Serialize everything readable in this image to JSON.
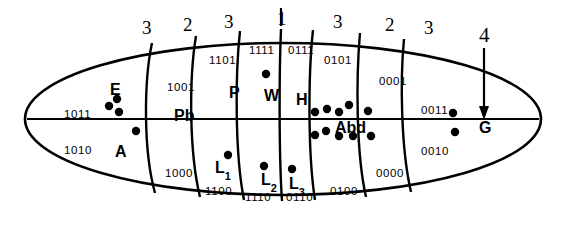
{
  "figure": {
    "type": "fate-map-diagram",
    "outline_shape": "ellipse",
    "midline": "horizontal"
  },
  "top_numbers": [
    {
      "id": "t1",
      "label": "3",
      "x": 142,
      "y": 18
    },
    {
      "id": "t2",
      "label": "2",
      "x": 183,
      "y": 15
    },
    {
      "id": "t3",
      "label": "3",
      "x": 224,
      "y": 12
    },
    {
      "id": "t4",
      "label": "1",
      "x": 277,
      "y": 9
    },
    {
      "id": "t5",
      "label": "3",
      "x": 333,
      "y": 12
    },
    {
      "id": "t6",
      "label": "2",
      "x": 385,
      "y": 15
    },
    {
      "id": "t7",
      "label": "3",
      "x": 424,
      "y": 18
    }
  ],
  "right_number": {
    "label": "4",
    "x": 479,
    "y": 25
  },
  "segments": [
    {
      "key": "E",
      "name": "E",
      "name_x": 110,
      "name_y": 82,
      "code_top": "1011",
      "code_top_x": 64,
      "code_top_y": 109,
      "code_bot": "1010",
      "code_bot_x": 64,
      "code_bot_y": 145
    },
    {
      "key": "A",
      "name": "A",
      "name_x": 115,
      "name_y": 144,
      "code_top": "",
      "code_top_x": 0,
      "code_top_y": 0,
      "code_bot": "",
      "code_bot_x": 0,
      "code_bot_y": 0
    },
    {
      "key": "Pb",
      "name": "Pb",
      "name_x": 174,
      "name_y": 108,
      "code_top": "1001",
      "code_top_x": 167,
      "code_top_y": 82,
      "code_bot": "1000",
      "code_bot_x": 165,
      "code_bot_y": 168
    },
    {
      "key": "P",
      "name": "P",
      "name_x": 229,
      "name_y": 85,
      "code_top": "1101",
      "code_top_x": 209,
      "code_top_y": 55,
      "code_bot": "1100",
      "code_bot_x": 205,
      "code_bot_y": 186
    },
    {
      "key": "W",
      "name": "W",
      "name_x": 264,
      "name_y": 88,
      "code_top": "1111",
      "code_top_x": 249,
      "code_top_y": 45,
      "code_bot": "1110",
      "code_bot_x": 245,
      "code_bot_y": 192
    },
    {
      "key": "H",
      "name": "H",
      "name_x": 296,
      "name_y": 92,
      "code_top": "0111",
      "code_top_x": 288,
      "code_top_y": 45,
      "code_bot": "0110",
      "code_bot_x": 286,
      "code_bot_y": 192
    },
    {
      "key": "Abd",
      "name": "Abd",
      "name_x": 335,
      "name_y": 120,
      "code_top": "0101",
      "code_top_x": 324,
      "code_top_y": 55,
      "code_bot": "0100",
      "code_bot_x": 330,
      "code_bot_y": 186
    },
    {
      "key": "S2",
      "name": "",
      "name_x": 0,
      "name_y": 0,
      "code_top": "0001",
      "code_top_x": 379,
      "code_top_y": 76,
      "code_bot": "0000",
      "code_bot_x": 376,
      "code_bot_y": 168
    },
    {
      "key": "G",
      "name": "G",
      "name_x": 479,
      "name_y": 120,
      "code_top": "0011",
      "code_top_x": 421,
      "code_top_y": 105,
      "code_bot": "0010",
      "code_bot_x": 421,
      "code_bot_y": 146
    }
  ],
  "leg_labels": [
    {
      "key": "L1",
      "base": "L",
      "sub": "1",
      "x": 215,
      "y": 160
    },
    {
      "key": "L2",
      "base": "L",
      "sub": "2",
      "x": 261,
      "y": 172
    },
    {
      "key": "L3",
      "base": "L",
      "sub": "3",
      "x": 289,
      "y": 176
    }
  ],
  "dots": {
    "radius": 4.2,
    "color": "#000000",
    "positions": [
      {
        "x": 117,
        "y": 99
      },
      {
        "x": 109,
        "y": 106
      },
      {
        "x": 119,
        "y": 112
      },
      {
        "x": 136,
        "y": 131
      },
      {
        "x": 266,
        "y": 74
      },
      {
        "x": 228,
        "y": 155
      },
      {
        "x": 264,
        "y": 166
      },
      {
        "x": 292,
        "y": 169
      },
      {
        "x": 315,
        "y": 112
      },
      {
        "x": 327,
        "y": 109
      },
      {
        "x": 339,
        "y": 112
      },
      {
        "x": 349,
        "y": 105
      },
      {
        "x": 368,
        "y": 111
      },
      {
        "x": 315,
        "y": 135
      },
      {
        "x": 326,
        "y": 131
      },
      {
        "x": 339,
        "y": 136
      },
      {
        "x": 353,
        "y": 136
      },
      {
        "x": 371,
        "y": 136
      },
      {
        "x": 453,
        "y": 113
      },
      {
        "x": 455,
        "y": 132
      }
    ]
  },
  "colors": {
    "ink": "#000000",
    "background": "#ffffff"
  }
}
